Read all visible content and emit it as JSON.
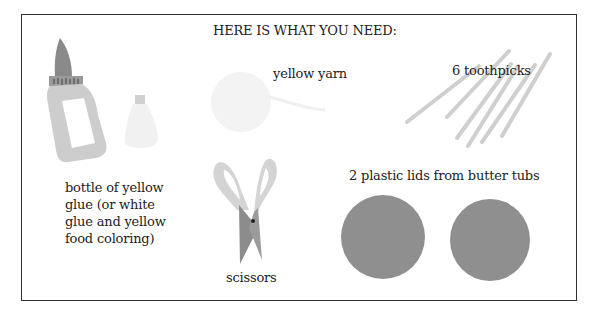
{
  "title": "HERE IS WHAT YOU NEED:",
  "items": {
    "glue": {
      "label_lines": [
        "bottle of yellow",
        "glue (or white",
        "glue and yellow",
        "food coloring)"
      ],
      "icon": "glue-bottle-icon"
    },
    "food_coloring": {
      "icon": "food-coloring-bottle-icon"
    },
    "yarn": {
      "label": "yellow yarn",
      "icon": "yarn-ball-icon"
    },
    "toothpicks": {
      "label": "6 toothpicks",
      "count": 6,
      "icon": "toothpick-icon"
    },
    "scissors": {
      "label": "scissors",
      "icon": "scissors-icon"
    },
    "lids": {
      "label": "2 plastic lids from butter tubs",
      "count": 2,
      "icon": "plastic-lid-icon"
    }
  },
  "colors": {
    "border": "#333333",
    "light_gray": "#cfcfcf",
    "dark_gray": "#8a8a8a",
    "lid_gray": "#8f8f8f",
    "faint": "#f1f1f1"
  }
}
